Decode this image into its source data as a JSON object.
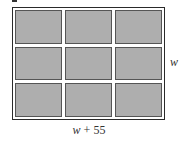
{
  "diagram": {
    "type": "rectangle-grid",
    "rows": 3,
    "columns": 3,
    "cell_fill": "#aeaeae",
    "frame_color": "#2a2a2a",
    "labels": {
      "height_var": "w",
      "length_var": "w",
      "length_op": " + 55"
    }
  },
  "cells": [
    {
      "row": 1,
      "col": 1
    },
    {
      "row": 1,
      "col": 2
    },
    {
      "row": 1,
      "col": 3
    },
    {
      "row": 2,
      "col": 1
    },
    {
      "row": 2,
      "col": 2
    },
    {
      "row": 2,
      "col": 3
    },
    {
      "row": 3,
      "col": 1
    },
    {
      "row": 3,
      "col": 2
    },
    {
      "row": 3,
      "col": 3
    }
  ]
}
